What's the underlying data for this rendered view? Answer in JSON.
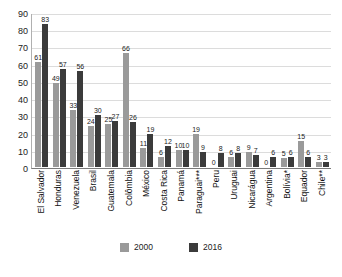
{
  "chart_data": {
    "type": "bar",
    "title": "",
    "subtitle": "",
    "xlabel": "",
    "ylabel": "",
    "ylim": [
      0,
      90
    ],
    "yticks": [
      0,
      10,
      20,
      30,
      40,
      50,
      60,
      70,
      80,
      90
    ],
    "grid": true,
    "legend_position": "bottom",
    "categories": [
      "El Salvador",
      "Honduras",
      "Venezuela",
      "Brasil",
      "Guatemala",
      "Colômbia",
      "México",
      "Costa Rica",
      "Panamá",
      "Paraguai***",
      "Peru",
      "Uruguai",
      "Nicarágua",
      "Argentina",
      "Bolívia*",
      "Equador",
      "Chile**"
    ],
    "series": [
      {
        "name": "2000",
        "color": "#9a9a9a",
        "values": [
          61,
          49,
          33,
          24,
          25,
          66,
          11,
          6,
          10,
          19,
          0,
          6,
          9,
          0,
          5,
          15,
          3
        ]
      },
      {
        "name": "2016",
        "color": "#3b3b3b",
        "values": [
          83,
          57,
          56,
          30,
          27,
          26,
          19,
          12,
          10,
          9,
          8,
          8,
          7,
          6,
          6,
          6,
          3
        ]
      }
    ]
  },
  "legend": {
    "items": [
      {
        "label": "2000",
        "color": "#9a9a9a"
      },
      {
        "label": "2016",
        "color": "#3b3b3b"
      }
    ]
  }
}
